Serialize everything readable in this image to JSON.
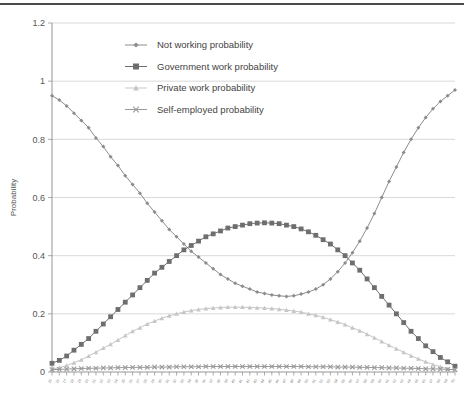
{
  "chart_data": {
    "type": "line",
    "title": "",
    "xlabel": "",
    "ylabel": "Probability",
    "ylim": [
      0,
      1.2
    ],
    "ytick_labels": [
      "0",
      "0.2",
      "0.4",
      "0.6",
      "0.8",
      "1",
      "1.2"
    ],
    "ytick_values": [
      0,
      0.2,
      0.4,
      0.6,
      0.8,
      1.0,
      1.2
    ],
    "grid": true,
    "legend_position": "top-center",
    "x": [
      15,
      16,
      17,
      18,
      19,
      20,
      21,
      22,
      23,
      24,
      25,
      26,
      27,
      28,
      29,
      30,
      31,
      32,
      33,
      34,
      35,
      36,
      37,
      38,
      39,
      40,
      41,
      42,
      43,
      44,
      45,
      46,
      47,
      48,
      49,
      50,
      51,
      52,
      53,
      54,
      55,
      56,
      57,
      58,
      59,
      60,
      61,
      62,
      63,
      64,
      65,
      66,
      67,
      68,
      69,
      70
    ],
    "xtick_labels": [
      "15",
      "16",
      "17",
      "18",
      "19",
      "20",
      "21",
      "22",
      "23",
      "24",
      "25",
      "26",
      "27",
      "28",
      "29",
      "30",
      "31",
      "32",
      "33",
      "34",
      "35",
      "36",
      "37",
      "38",
      "39",
      "40",
      "41",
      "42",
      "43",
      "44",
      "45",
      "46",
      "47",
      "48",
      "49",
      "50",
      "51",
      "52",
      "53",
      "54",
      "55",
      "56",
      "57",
      "58",
      "59",
      "60",
      "61",
      "62",
      "63",
      "64",
      "65",
      "66",
      "67",
      "68",
      "69",
      "70"
    ],
    "series": [
      {
        "name": "Not working probability",
        "marker": "diamond",
        "color": "#8c8c8c",
        "values": [
          0.95,
          0.935,
          0.915,
          0.89,
          0.865,
          0.84,
          0.805,
          0.775,
          0.74,
          0.71,
          0.675,
          0.645,
          0.615,
          0.58,
          0.55,
          0.52,
          0.49,
          0.465,
          0.44,
          0.415,
          0.395,
          0.375,
          0.355,
          0.335,
          0.32,
          0.305,
          0.295,
          0.285,
          0.275,
          0.27,
          0.265,
          0.262,
          0.26,
          0.262,
          0.268,
          0.275,
          0.285,
          0.3,
          0.32,
          0.345,
          0.375,
          0.41,
          0.45,
          0.495,
          0.545,
          0.6,
          0.655,
          0.705,
          0.755,
          0.8,
          0.84,
          0.875,
          0.905,
          0.93,
          0.95,
          0.97
        ]
      },
      {
        "name": "Government work probability",
        "marker": "square",
        "color": "#6e6e6e",
        "values": [
          0.03,
          0.04,
          0.055,
          0.075,
          0.095,
          0.115,
          0.14,
          0.165,
          0.19,
          0.215,
          0.24,
          0.265,
          0.29,
          0.315,
          0.34,
          0.36,
          0.38,
          0.4,
          0.42,
          0.435,
          0.45,
          0.465,
          0.475,
          0.485,
          0.495,
          0.5,
          0.505,
          0.51,
          0.512,
          0.513,
          0.512,
          0.51,
          0.505,
          0.5,
          0.492,
          0.482,
          0.47,
          0.455,
          0.44,
          0.42,
          0.4,
          0.375,
          0.35,
          0.32,
          0.29,
          0.26,
          0.23,
          0.2,
          0.17,
          0.14,
          0.115,
          0.09,
          0.07,
          0.05,
          0.035,
          0.02
        ]
      },
      {
        "name": "Private work probability",
        "marker": "triangle",
        "color": "#c6c6c6",
        "values": [
          0.01,
          0.015,
          0.022,
          0.032,
          0.042,
          0.055,
          0.068,
          0.082,
          0.095,
          0.11,
          0.125,
          0.14,
          0.152,
          0.165,
          0.175,
          0.185,
          0.193,
          0.2,
          0.206,
          0.211,
          0.215,
          0.218,
          0.22,
          0.222,
          0.223,
          0.223,
          0.223,
          0.222,
          0.221,
          0.22,
          0.218,
          0.216,
          0.213,
          0.21,
          0.206,
          0.2,
          0.195,
          0.188,
          0.18,
          0.172,
          0.163,
          0.152,
          0.142,
          0.13,
          0.118,
          0.105,
          0.092,
          0.08,
          0.068,
          0.056,
          0.045,
          0.035,
          0.026,
          0.018,
          0.011,
          0.006
        ]
      },
      {
        "name": "Self-employed probability",
        "marker": "cross",
        "color": "#9a9a9a",
        "values": [
          0.008,
          0.009,
          0.01,
          0.011,
          0.012,
          0.013,
          0.013,
          0.014,
          0.014,
          0.015,
          0.015,
          0.016,
          0.016,
          0.016,
          0.017,
          0.017,
          0.017,
          0.018,
          0.018,
          0.018,
          0.018,
          0.019,
          0.019,
          0.019,
          0.019,
          0.019,
          0.019,
          0.019,
          0.019,
          0.019,
          0.019,
          0.019,
          0.019,
          0.019,
          0.019,
          0.018,
          0.018,
          0.018,
          0.018,
          0.017,
          0.017,
          0.017,
          0.016,
          0.016,
          0.015,
          0.015,
          0.014,
          0.014,
          0.013,
          0.013,
          0.012,
          0.011,
          0.011,
          0.01,
          0.009,
          0.008
        ]
      }
    ]
  }
}
